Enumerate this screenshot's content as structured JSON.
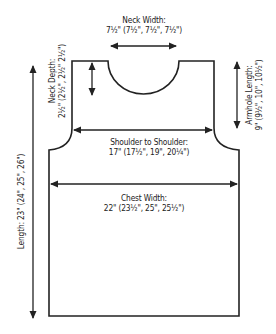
{
  "diagram": {
    "type": "knitting-schematic-vest-front",
    "stroke_color": "#222222",
    "background": "#ffffff",
    "measurements": {
      "neck_width": {
        "label": "Neck Width:",
        "value": "7½\" (7½\", 7½\", 7½\")"
      },
      "neck_depth": {
        "label": "Neck Depth:",
        "value": "2½\" (2½\", 2½\" 2½\")"
      },
      "armhole_length": {
        "label": "Armhole Length:",
        "value": "9\" (9½\", 10\", 10½\")"
      },
      "shoulder_to_shoulder": {
        "label": "Shoulder to Shoulder:",
        "value": "17\" (17½\", 19\", 20¼\")"
      },
      "chest_width": {
        "label": "Chest Width:",
        "value": "22\" (23½\", 25\", 25½\")"
      },
      "length": {
        "label": "Length:",
        "value": "23\" (24\", 25\", 26\")",
        "full": "Length: 23\" (24\", 25\", 26\")"
      }
    }
  }
}
